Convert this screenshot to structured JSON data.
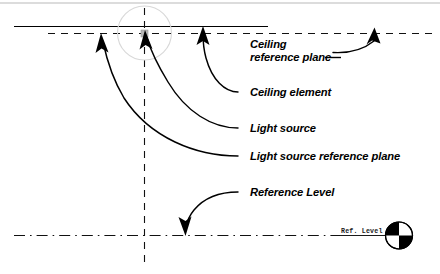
{
  "diagram": {
    "title": "Light source and ceiling reference planes section diagram",
    "background_color": "#ffffff",
    "ink_color": "#000000",
    "callouts": [
      {
        "id": "ceiling-reference-plane",
        "label_line_1": "Ceiling",
        "label_line_2": "reference plane",
        "points_to": "top dashed horizontal plane (right end)"
      },
      {
        "id": "ceiling-element",
        "label": "Ceiling element",
        "points_to": "top solid horizontal line"
      },
      {
        "id": "light-source",
        "label": "Light source",
        "points_to": "intersection node at center of top planes"
      },
      {
        "id": "light-source-reference-plane",
        "label": "Light source reference plane",
        "points_to": "top dashed horizontal plane (left portion)"
      },
      {
        "id": "reference-level",
        "label": "Reference Level",
        "points_to": "bottom dash-dot datum line"
      }
    ],
    "level_symbol": {
      "label": "Ref. Level",
      "marker": "level-target-icon",
      "dark_quadrants": "top-left and bottom-right"
    },
    "geometry": {
      "ceiling_element_line": "solid",
      "ceiling_reference_plane_line": "dashed",
      "light_source_reference_plane_line": "dashed",
      "vertical_axis_line": "dashed",
      "reference_level_line": "dash-dot"
    }
  }
}
